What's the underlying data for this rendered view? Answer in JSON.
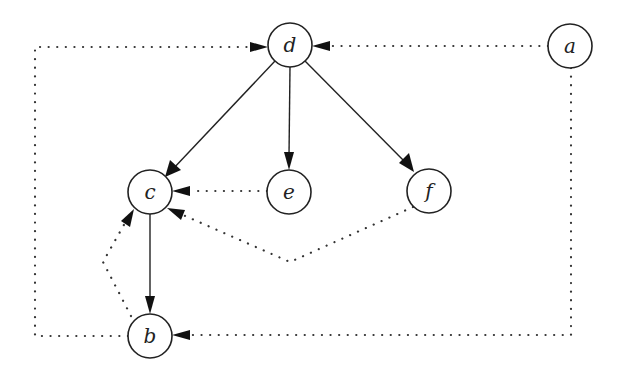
{
  "diagram": {
    "type": "directed-graph",
    "node_radius": 22,
    "colors": {
      "stroke": "#222222",
      "background": "#ffffff",
      "arrow": "#111111"
    },
    "nodes": [
      {
        "id": "a",
        "label": "a",
        "x": 570,
        "y": 46
      },
      {
        "id": "b",
        "label": "b",
        "x": 150,
        "y": 336
      },
      {
        "id": "c",
        "label": "c",
        "x": 150,
        "y": 192
      },
      {
        "id": "d",
        "label": "d",
        "x": 290,
        "y": 45
      },
      {
        "id": "e",
        "label": "e",
        "x": 289,
        "y": 192
      },
      {
        "id": "f",
        "label": "f",
        "x": 429,
        "y": 191
      }
    ],
    "edges": [
      {
        "from": "d",
        "to": "c",
        "style": "solid"
      },
      {
        "from": "d",
        "to": "e",
        "style": "solid"
      },
      {
        "from": "d",
        "to": "f",
        "style": "solid"
      },
      {
        "from": "c",
        "to": "b",
        "style": "solid"
      },
      {
        "from": "a",
        "to": "d",
        "style": "dotted"
      },
      {
        "from": "a",
        "to": "b",
        "style": "dotted",
        "route": "right-and-bottom"
      },
      {
        "from": "b",
        "to": "d",
        "style": "dotted",
        "route": "left-and-top"
      },
      {
        "from": "e",
        "to": "c",
        "style": "dotted"
      },
      {
        "from": "f",
        "to": "c",
        "style": "dotted",
        "route": "bent-below"
      },
      {
        "from": "b",
        "to": "c",
        "style": "dotted",
        "route": "bent-left"
      }
    ]
  }
}
